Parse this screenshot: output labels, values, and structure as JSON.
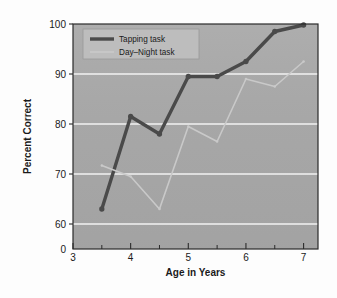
{
  "figure": {
    "background_color": "#fdfdfd",
    "plot_background_color": "#a8a8a8",
    "gridline_color": "#f2f2f2",
    "frame_color": "#2b2b2b"
  },
  "axes": {
    "x_title": "Age in Years",
    "y_title": "Percent Correct",
    "x_ticks": [
      "3",
      "4",
      "5",
      "6",
      "7"
    ],
    "y_ticks": [
      "0",
      "60",
      "70",
      "80",
      "90",
      "100"
    ],
    "y_break_label": "0"
  },
  "legend": {
    "position": "top-left-inside",
    "background_color": "#bdbdbd",
    "items": [
      {
        "label": "Tapping task",
        "color": "#4a4a4a",
        "line_width": 3.4
      },
      {
        "label": "Day–Night task",
        "color": "#c9c9c9",
        "line_width": 1.6
      }
    ]
  },
  "chart_data": {
    "type": "line",
    "title": "",
    "xlabel": "Age in Years",
    "ylabel": "Percent Correct",
    "xlim": [
      3,
      7.25
    ],
    "ylim": [
      55,
      100
    ],
    "y_axis_break": true,
    "y_axis_break_between": [
      0,
      60
    ],
    "grid": true,
    "grid_axis": "y",
    "gridlines": [
      60,
      70,
      80,
      90,
      100
    ],
    "x_major_ticks": [
      3,
      4,
      5,
      6,
      7
    ],
    "x_minor_ticks": [
      3.5,
      4.5,
      5.5,
      6.5
    ],
    "legend_position": "upper left",
    "x": [
      3.5,
      4,
      4.5,
      5,
      5.5,
      6,
      6.5,
      7
    ],
    "series": [
      {
        "name": "Tapping task",
        "color": "#4a4a4a",
        "line_width": 3.4,
        "marker": "circle",
        "values": [
          63,
          81.5,
          78,
          89.5,
          89.5,
          92.5,
          98.5,
          99.8
        ]
      },
      {
        "name": "Day–Night task",
        "color": "#c9c9c9",
        "line_width": 1.6,
        "marker": "circle",
        "values": [
          71.7,
          69.5,
          63,
          79.5,
          76.5,
          89,
          87.5,
          92.5
        ]
      }
    ]
  }
}
